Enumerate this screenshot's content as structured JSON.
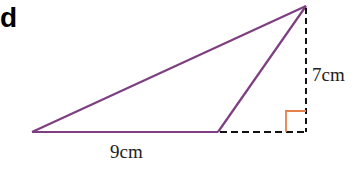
{
  "figure": {
    "part_label": "d",
    "base_label": "9cm",
    "height_label": "7cm",
    "colors": {
      "triangle": "#7d3f82",
      "dashed": "#111111",
      "right_angle": "#e8804a"
    },
    "shape": "obtuse triangle with external height",
    "base_length_cm": 9,
    "height_cm": 7
  }
}
